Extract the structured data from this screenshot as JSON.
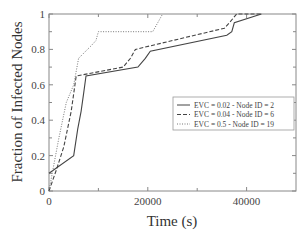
{
  "chart_data": {
    "type": "line",
    "title": "",
    "xlabel": "Time (s)",
    "ylabel": "Fraction of Infected Nodes",
    "xlim": [
      0,
      50000
    ],
    "ylim": [
      0,
      1
    ],
    "x_ticks": [
      0,
      20000,
      40000
    ],
    "x_tick_labels": [
      "0",
      "20000",
      "40000"
    ],
    "x_minor_ticks": [
      10000,
      30000
    ],
    "y_ticks": [
      0,
      0.2,
      0.4,
      0.6,
      0.8,
      1
    ],
    "y_tick_labels": [
      "0",
      "0.2",
      "0.4",
      "0.6",
      "0.8",
      "1"
    ],
    "y_minor_ticks": [
      0.1,
      0.3,
      0.5,
      0.7,
      0.9
    ],
    "grid": false,
    "legend_position": "lower-right",
    "series": [
      {
        "name": "EVC = 0.02 - Node ID = 2",
        "style": "solid",
        "color": "#444444",
        "x": [
          0,
          5000,
          5800,
          6500,
          7000,
          7500,
          18000,
          19500,
          20500,
          36000,
          37000,
          37500,
          43000
        ],
        "y": [
          0.1,
          0.2,
          0.35,
          0.45,
          0.55,
          0.65,
          0.7,
          0.75,
          0.79,
          0.88,
          0.9,
          0.95,
          1.0
        ]
      },
      {
        "name": "EVC = 0.04 - Node ID = 6",
        "style": "dashed",
        "color": "#444444",
        "x": [
          0,
          1500,
          3000,
          4500,
          5500,
          15000,
          16500,
          17500,
          35500,
          36500,
          38000,
          43000
        ],
        "y": [
          0.0,
          0.12,
          0.25,
          0.45,
          0.65,
          0.7,
          0.75,
          0.8,
          0.92,
          0.95,
          1.0,
          1.0
        ]
      },
      {
        "name": "EVC = 0.5 - Node ID = 19",
        "style": "dotted",
        "color": "#777777",
        "x": [
          0,
          1000,
          2000,
          3500,
          5000,
          6000,
          8500,
          9500,
          10000,
          21000,
          22000,
          23000
        ],
        "y": [
          0.0,
          0.15,
          0.3,
          0.5,
          0.6,
          0.75,
          0.82,
          0.85,
          0.9,
          0.9,
          0.95,
          1.0
        ]
      }
    ]
  }
}
